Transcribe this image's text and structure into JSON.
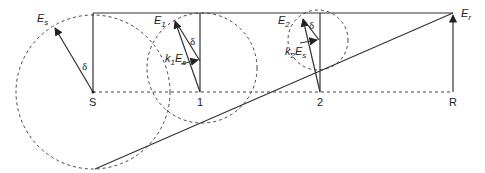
{
  "diagram": {
    "type": "phasor-diagram",
    "colors": {
      "line": "#333333",
      "dashed": "#444444",
      "text": "#222222"
    },
    "nodes": [
      {
        "id": "S",
        "label": "S"
      },
      {
        "id": "1",
        "label": "1"
      },
      {
        "id": "2",
        "label": "2"
      },
      {
        "id": "R",
        "label": "R"
      }
    ],
    "phasors": {
      "Es": {
        "main": "E",
        "sub": "s"
      },
      "E1": {
        "main": "E",
        "sub": "1"
      },
      "E2": {
        "main": "E",
        "sub": "2"
      },
      "Er": {
        "main": "E",
        "sub": "r"
      }
    },
    "annotations": {
      "k1Es": {
        "k": "k",
        "ksub": "1",
        "main": "E",
        "sub": "s"
      },
      "k2Es": {
        "k": "k",
        "ksub": "2",
        "main": "E",
        "sub": "s"
      },
      "delta": "δ"
    }
  }
}
